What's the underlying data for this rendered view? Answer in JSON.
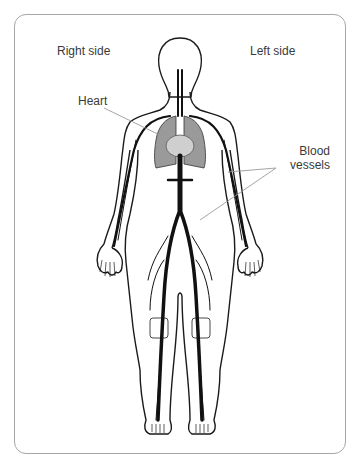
{
  "diagram": {
    "labels": {
      "right_side": "Right side",
      "left_side": "Left side",
      "heart": "Heart",
      "blood_vessels_line1": "Blood",
      "blood_vessels_line2": "vessels"
    },
    "colors": {
      "outline": "#1a1a1a",
      "vessels": "#111111",
      "organs": "#9a9a9a",
      "heart": "#cfcfcf",
      "leader_lines": "#9a9a9a",
      "frame": "#a6a6a6",
      "text": "#3a3a3a"
    }
  }
}
